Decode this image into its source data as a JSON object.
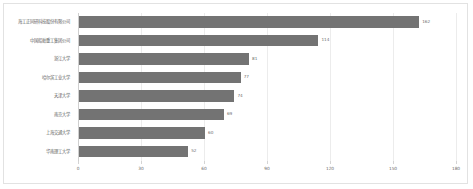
{
  "chart_data": {
    "type": "bar",
    "orientation": "horizontal",
    "title": "",
    "xlabel": "",
    "ylabel": "",
    "xlim": [
      0,
      180
    ],
    "xticks": [
      0,
      30,
      60,
      90,
      120,
      150,
      180
    ],
    "grid": true,
    "legend": "none",
    "bar_color": "#737373",
    "categories": [
      "海工正同研科技股份有限公司",
      "中国船舶重工集团公司",
      "浙江大学",
      "哈尔滨工业大学",
      "天津大学",
      "南京大学",
      "上海交通大学",
      "华南理工大学"
    ],
    "values": [
      162,
      114,
      81,
      77,
      74,
      69,
      60,
      52
    ]
  },
  "panel": {
    "background": "#ffffff",
    "border_color": "#e2e2e2",
    "gridline_color": "#ececec",
    "axis_color": "#cfcfcf",
    "tick_text_color": "#6e6e6e",
    "label_text_color": "#5d5d5d"
  }
}
